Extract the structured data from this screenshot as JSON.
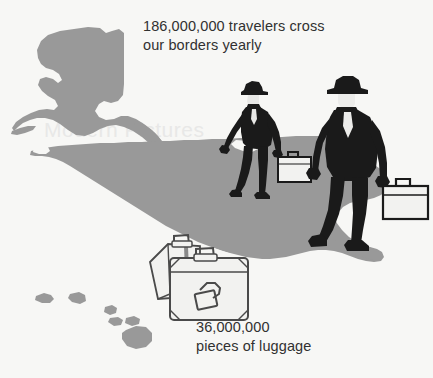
{
  "illustration": {
    "title": "Travelers and luggage crossing US borders",
    "background_color": "#f7f7f5",
    "map_color": "#999999",
    "figure_color": "#1a1a1a",
    "luggage_color": "#f2f2f0",
    "text_color": "#313131"
  },
  "captions": {
    "travelers": "186,000,000 travelers cross\nour borders yearly",
    "luggage": "36,000,000\npieces of luggage"
  },
  "statistics": [
    {
      "value": "186,000,000",
      "unit": "travelers",
      "description": "travelers cross our borders yearly"
    },
    {
      "value": "36,000,000",
      "unit": "pieces of luggage",
      "description": "pieces of luggage"
    }
  ],
  "map": {
    "name": "united-states",
    "regions": [
      "alaska",
      "continental-united-states",
      "hawaii"
    ]
  },
  "figures": [
    {
      "name": "traveler-back",
      "description": "man in suit and hat walking with briefcase"
    },
    {
      "name": "traveler-front",
      "description": "larger man in suit and hat walking with briefcase"
    }
  ],
  "luggage_items": [
    {
      "name": "suitcase-rear"
    },
    {
      "name": "suitcase-front"
    }
  ],
  "artifacts": {
    "top_edge_text": "· ·· · ·· ···",
    "bleed_text": "Modern Pictures"
  }
}
